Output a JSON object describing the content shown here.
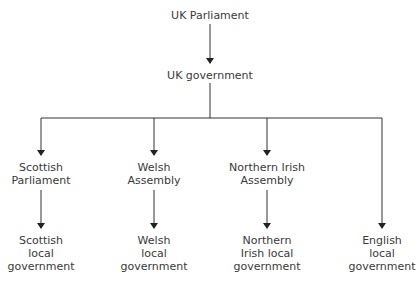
{
  "diagram": {
    "nodes": {
      "uk_parliament": [
        "UK Parliament"
      ],
      "uk_government": [
        "UK government"
      ],
      "scottish_parliament": [
        "Scottish",
        "Parliament"
      ],
      "welsh_assembly": [
        "Welsh",
        "Assembly"
      ],
      "ni_assembly": [
        "Northern Irish",
        "Assembly"
      ],
      "scottish_local": [
        "Scottish",
        "local",
        "government"
      ],
      "welsh_local": [
        "Welsh",
        "local",
        "government"
      ],
      "ni_local": [
        "Northern",
        "Irish local",
        "government"
      ],
      "english_local": [
        "English",
        "local",
        "government"
      ]
    },
    "edges": [
      [
        "UK Parliament",
        "UK government"
      ],
      [
        "UK government",
        "Scottish Parliament"
      ],
      [
        "UK government",
        "Welsh Assembly"
      ],
      [
        "UK government",
        "Northern Irish Assembly"
      ],
      [
        "UK government",
        "English local government"
      ],
      [
        "Scottish Parliament",
        "Scottish local government"
      ],
      [
        "Welsh Assembly",
        "Welsh local government"
      ],
      [
        "Northern Irish Assembly",
        "Northern Irish local government"
      ]
    ],
    "line_color": "#333333"
  }
}
